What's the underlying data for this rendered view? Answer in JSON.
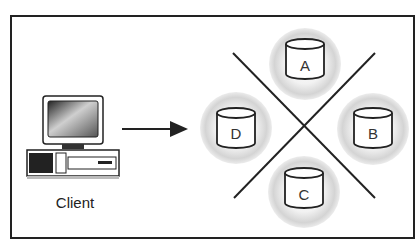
{
  "caption": "Figure: Client accessing partitioned servers",
  "client": {
    "label": "Client",
    "icon": "desktop-computer-icon"
  },
  "arrow": {
    "direction": "right"
  },
  "nodes": [
    {
      "id": "A",
      "label": "A",
      "position": "top"
    },
    {
      "id": "B",
      "label": "B",
      "position": "right"
    },
    {
      "id": "C",
      "label": "C",
      "position": "bottom"
    },
    {
      "id": "D",
      "label": "D",
      "position": "left"
    }
  ],
  "colors": {
    "stroke": "#222222",
    "halo": "#d6d6d6",
    "background": "#ffffff"
  }
}
